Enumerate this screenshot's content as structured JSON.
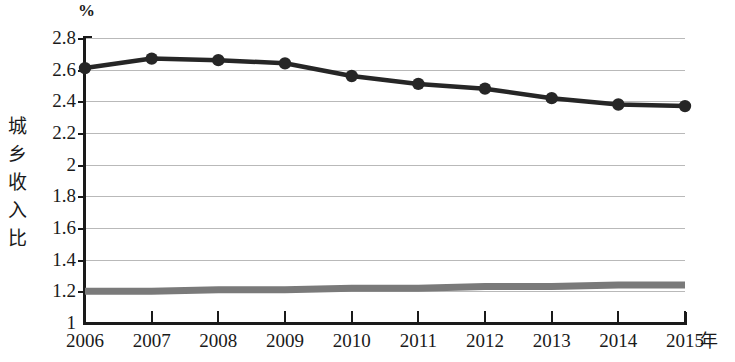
{
  "chart_data": {
    "type": "line",
    "title": "",
    "xlabel": "年",
    "ylabel": "城乡收入比",
    "unit_label": "%",
    "categories": [
      "2006",
      "2007",
      "2008",
      "2009",
      "2010",
      "2011",
      "2012",
      "2013",
      "2014",
      "2015"
    ],
    "x": [
      2006,
      2007,
      2008,
      2009,
      2010,
      2011,
      2012,
      2013,
      2014,
      2015
    ],
    "ylim": [
      1,
      2.8
    ],
    "xlim": [
      2006,
      2015
    ],
    "yticks": [
      "1",
      "1.2",
      "1.4",
      "1.6",
      "1.8",
      "2",
      "2.2",
      "2.4",
      "2.6",
      "2.8"
    ],
    "ytick_values": [
      1,
      1.2,
      1.4,
      1.6,
      1.8,
      2,
      2.2,
      2.4,
      2.6,
      2.8
    ],
    "grid": true,
    "legend": "none",
    "series": [
      {
        "name": "城乡收入比",
        "color": "#262626",
        "marker": "circle",
        "values": [
          2.61,
          2.67,
          2.66,
          2.64,
          2.56,
          2.51,
          2.48,
          2.42,
          2.38,
          2.37
        ]
      },
      {
        "name": "基准线",
        "color": "#7a7a7a",
        "marker": "none",
        "values": [
          1.2,
          1.2,
          1.21,
          1.21,
          1.22,
          1.22,
          1.23,
          1.23,
          1.24,
          1.24
        ]
      }
    ]
  },
  "axis": {
    "unit": "%",
    "y_title_chars": [
      "城",
      "乡",
      "收",
      "入",
      "比"
    ],
    "x_title": "年"
  },
  "colors": {
    "series_primary": "#262626",
    "series_secondary": "#7a7a7a",
    "gridline": "#b9b9b9",
    "axis": "#1a1a1a",
    "background": "#ffffff"
  }
}
